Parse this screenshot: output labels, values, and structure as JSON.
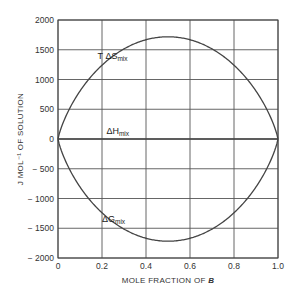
{
  "chart_data": {
    "type": "line",
    "title": "",
    "xlabel": "MOLE FRACTION OF B",
    "xlabel_prefix": "MOLE FRACTION OF ",
    "xlabel_var": "B",
    "ylabel": "J MOL⁻¹ OF SOLUTION",
    "xlim": [
      0,
      1.0
    ],
    "ylim": [
      -2000,
      2000
    ],
    "grid": true,
    "x_ticks": [
      "0",
      "0.2",
      "0.4",
      "0.6",
      "0.8",
      "1.0"
    ],
    "y_ticks": [
      "2000",
      "1500",
      "1000",
      "500",
      "0",
      "-500",
      "-1000",
      "-1500",
      "-2000"
    ],
    "x": [
      0,
      0.05,
      0.1,
      0.15,
      0.2,
      0.25,
      0.3,
      0.35,
      0.4,
      0.45,
      0.5,
      0.55,
      0.6,
      0.65,
      0.7,
      0.75,
      0.8,
      0.85,
      0.9,
      0.95,
      1.0
    ],
    "series": [
      {
        "name": "T ΔS_mix",
        "label_main": "T ΔS",
        "label_sub": "mix",
        "values": [
          0,
          490,
          806,
          1044,
          1240,
          1393,
          1513,
          1603,
          1667,
          1706,
          1718,
          1706,
          1667,
          1603,
          1513,
          1393,
          1240,
          1044,
          806,
          490,
          0
        ]
      },
      {
        "name": "ΔH_mix",
        "label_main": "ΔH",
        "label_sub": "mix",
        "values": [
          0,
          0,
          0,
          0,
          0,
          0,
          0,
          0,
          0,
          0,
          0,
          0,
          0,
          0,
          0,
          0,
          0,
          0,
          0,
          0,
          0
        ]
      },
      {
        "name": "ΔG_mix",
        "label_main": "ΔG",
        "label_sub": "mix",
        "values": [
          0,
          -490,
          -806,
          -1044,
          -1240,
          -1393,
          -1513,
          -1603,
          -1667,
          -1706,
          -1718,
          -1706,
          -1667,
          -1603,
          -1513,
          -1393,
          -1240,
          -1044,
          -806,
          -490,
          0
        ]
      }
    ],
    "annotations": [
      {
        "text": "T ΔS_mix",
        "x": 0.18,
        "y": 1350
      },
      {
        "text": "ΔH_mix",
        "x": 0.22,
        "y": 90
      },
      {
        "text": "ΔG_mix",
        "x": 0.2,
        "y": -1400
      }
    ],
    "colors": {
      "curve": "#444444",
      "grid": "#555555",
      "axis": "#444444"
    }
  }
}
